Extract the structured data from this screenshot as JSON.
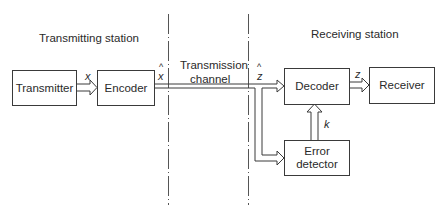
{
  "diagram": {
    "sections": {
      "transmitting": "Transmitting station",
      "channel_line1": "Transmission",
      "channel_line2": "channel",
      "receiving": "Receiving station"
    },
    "blocks": {
      "transmitter": "Transmitter",
      "encoder": "Encoder",
      "decoder": "Decoder",
      "receiver": "Receiver",
      "error_detector_line1": "Error",
      "error_detector_line2": "detector"
    },
    "signals": {
      "x": "x",
      "x_hat": "x",
      "z_hat": "z",
      "z": "z",
      "k": "k",
      "hat_symbol": "^"
    },
    "edges": [
      {
        "from": "Transmitter",
        "to": "Encoder",
        "label": "x"
      },
      {
        "from": "Encoder",
        "to": "Decoder",
        "label": "x̂ → ẑ",
        "via": "Transmission channel"
      },
      {
        "from": "Transmission channel",
        "to": "Error detector",
        "label": "ẑ"
      },
      {
        "from": "Error detector",
        "to": "Decoder",
        "label": "k"
      },
      {
        "from": "Decoder",
        "to": "Receiver",
        "label": "z"
      }
    ],
    "colors": {
      "line": "#3a3a3a",
      "background": "#ffffff"
    }
  }
}
